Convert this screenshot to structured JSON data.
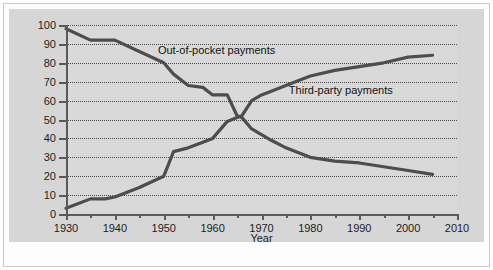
{
  "chart_data": {
    "type": "line",
    "title": "",
    "xlabel": "Year",
    "ylabel": "Percentage of Health Care Payments",
    "xlim": [
      1930,
      2010
    ],
    "ylim": [
      0,
      100
    ],
    "grid": true,
    "legend_position": "inline-annotations",
    "x_ticks": [
      1930,
      1940,
      1950,
      1960,
      1970,
      1980,
      1990,
      2000,
      2010
    ],
    "x_minor_ticks": [
      1935,
      1945,
      1955,
      1965,
      1975,
      1985,
      1995,
      2005
    ],
    "y_ticks": [
      0,
      10,
      20,
      30,
      40,
      50,
      60,
      70,
      80,
      90,
      100
    ],
    "series": [
      {
        "name": "Out-of-pocket payments",
        "color": "#4d4d4d",
        "x": [
          1930,
          1935,
          1938,
          1940,
          1945,
          1950,
          1952,
          1955,
          1958,
          1960,
          1963,
          1965,
          1966,
          1968,
          1970,
          1972,
          1975,
          1978,
          1980,
          1985,
          1990,
          1995,
          2000,
          2005
        ],
        "values": [
          98,
          92,
          92,
          92,
          86,
          80,
          74,
          68,
          67,
          63,
          63,
          52,
          51,
          45,
          42,
          39,
          35,
          32,
          30,
          28,
          27,
          25,
          23,
          21
        ]
      },
      {
        "name": "Third-party payments",
        "color": "#4d4d4d",
        "x": [
          1930,
          1935,
          1938,
          1940,
          1945,
          1950,
          1952,
          1955,
          1958,
          1960,
          1963,
          1965,
          1966,
          1968,
          1970,
          1972,
          1975,
          1978,
          1980,
          1985,
          1990,
          1995,
          2000,
          2005
        ],
        "values": [
          3,
          8,
          8,
          9,
          14,
          20,
          33,
          35,
          38,
          40,
          49,
          51,
          52,
          60,
          63,
          65,
          68,
          71,
          73,
          76,
          78,
          80,
          83,
          84
        ]
      }
    ],
    "annotations": [
      {
        "text": "Out-of-pocket payments",
        "x_pct": 23.5,
        "y_pct": 10.5
      },
      {
        "text": "Third-party payments",
        "x_pct": 57.0,
        "y_pct": 32.0
      }
    ]
  }
}
